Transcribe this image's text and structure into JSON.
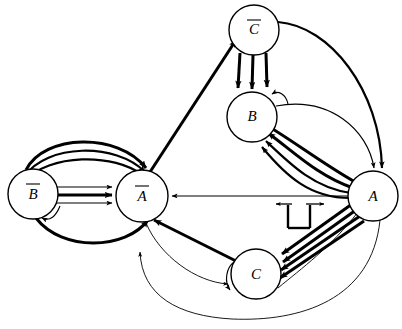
{
  "diagram": {
    "background_color": "#ffffff",
    "line_color": "#000000",
    "nodes": [
      {
        "id": "Cbar",
        "label": "C",
        "overbar": true,
        "cx": 254,
        "cy": 30,
        "r": 25,
        "name": "node-c-bar"
      },
      {
        "id": "B",
        "label": "B",
        "overbar": false,
        "cx": 252,
        "cy": 117,
        "r": 25,
        "name": "node-b"
      },
      {
        "id": "Abar",
        "label": "A",
        "overbar": true,
        "cx": 142,
        "cy": 196,
        "r": 26,
        "name": "node-a-bar"
      },
      {
        "id": "Bbar",
        "label": "B",
        "overbar": true,
        "cx": 33,
        "cy": 194,
        "r": 25,
        "name": "node-b-bar"
      },
      {
        "id": "A",
        "label": "A",
        "overbar": false,
        "cx": 373,
        "cy": 196,
        "r": 25,
        "name": "node-a"
      },
      {
        "id": "C",
        "label": "C",
        "overbar": false,
        "cx": 256,
        "cy": 274,
        "r": 25,
        "name": "node-c"
      }
    ],
    "edge_bundles": [
      {
        "from": "Bbar",
        "to": "Abar",
        "count": 7,
        "style": "mixed-arcs",
        "name": "bundle-bbar-to-abar"
      },
      {
        "from": "Cbar",
        "to": "B",
        "count": 3,
        "style": "parallel-vertical",
        "name": "bundle-cbar-to-b"
      },
      {
        "from": "A",
        "to": "B",
        "count": 4,
        "style": "curved-fan",
        "name": "bundle-a-to-b"
      },
      {
        "from": "A",
        "to": "C",
        "count": 4,
        "style": "parallel-diagonal",
        "name": "bundle-a-to-c"
      },
      {
        "from": "A",
        "to": "Abar",
        "count": 1,
        "style": "straight-thin",
        "name": "edge-a-to-abar"
      },
      {
        "from": "Abar",
        "to": "Cbar",
        "count": 1,
        "style": "straight-thick",
        "name": "edge-abar-to-cbar"
      },
      {
        "from": "C",
        "to": "Abar",
        "count": 1,
        "style": "straight-thick",
        "name": "edge-c-to-abar"
      },
      {
        "from": "Abar",
        "to": "C",
        "count": 1,
        "style": "curved-thin",
        "name": "edge-abar-to-c"
      },
      {
        "from": "Cbar",
        "to": "A",
        "count": 1,
        "style": "long-arc-top",
        "name": "edge-cbar-to-a"
      },
      {
        "from": "A",
        "to": "Abar",
        "count": 1,
        "style": "long-arc-bottom",
        "name": "edge-a-to-abar-arc"
      },
      {
        "from": "B",
        "to": "A",
        "count": 1,
        "style": "arc-right",
        "name": "edge-b-to-a"
      }
    ],
    "annotations": [
      {
        "type": "t-bar",
        "name": "t-bar-inhibition-symbol",
        "x": 302,
        "y": 203,
        "description": "bidirectional horizontal arrow over a T-shaped stem"
      }
    ]
  }
}
